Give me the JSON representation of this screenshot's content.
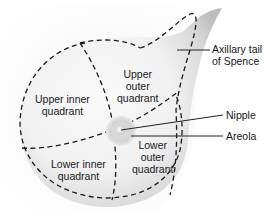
{
  "diagram": {
    "quadrants": [
      {
        "id": "upper-inner",
        "line1": "Upper inner",
        "line2": "quadrant"
      },
      {
        "id": "upper-outer",
        "line1": "Upper",
        "line2": "outer",
        "line3": "quadrant"
      },
      {
        "id": "lower-inner",
        "line1": "Lower inner",
        "line2": "quadrant"
      },
      {
        "id": "lower-outer",
        "line1": "Lower",
        "line2": "outer",
        "line3": "quadrant"
      }
    ],
    "callouts": [
      {
        "id": "axillary-tail",
        "line1": "Axillary tail",
        "line2": "of Spence"
      },
      {
        "id": "nipple",
        "line1": "Nipple"
      },
      {
        "id": "areola",
        "line1": "Areola"
      }
    ],
    "colors": {
      "dash": "#1a1a1a",
      "leader": "#222222",
      "text": "#1a1a1a",
      "skin_light": "#f4f4f4",
      "skin_shadow": "#bdbdbd",
      "areola": "#d8d8d8",
      "nipple": "#f0f0f0"
    }
  }
}
